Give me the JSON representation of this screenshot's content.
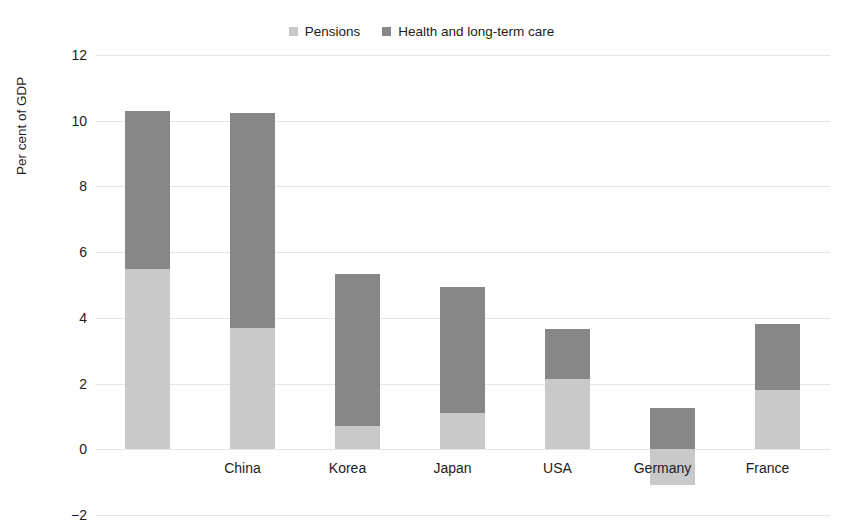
{
  "chart_data": {
    "type": "bar",
    "stacked": true,
    "title": "",
    "subtitle": "",
    "xlabel": "",
    "ylabel": "Per cent of GDP",
    "categories": [
      "China",
      "Korea",
      "Japan",
      "USA",
      "Germany",
      "France",
      "Italy"
    ],
    "series": [
      {
        "name": "Pensions",
        "color": "#c9c9c9",
        "values": [
          5.5,
          3.7,
          0.7,
          1.1,
          2.15,
          -1.1,
          1.8
        ]
      },
      {
        "name": "Health and long-term care",
        "color": "#878787",
        "values": [
          4.8,
          6.55,
          4.65,
          3.85,
          1.5,
          1.25,
          2.0
        ]
      }
    ],
    "totals": [
      10.3,
      10.25,
      5.35,
      4.95,
      3.65,
      1.25,
      3.8
    ],
    "ylim": [
      -2,
      12
    ],
    "yticks": [
      12,
      10,
      8,
      6,
      4,
      2,
      0,
      -2
    ],
    "ytick_labels": [
      "12",
      "10",
      "8",
      "6",
      "4",
      "2",
      "0",
      "−2"
    ],
    "grid": true,
    "legend_position": "top-center"
  },
  "legend": {
    "items": [
      {
        "label": "Pensions",
        "color": "#c9c9c9"
      },
      {
        "label": "Health and long-term care",
        "color": "#878787"
      }
    ]
  },
  "axes": {
    "y_title": "Per cent of GDP"
  }
}
